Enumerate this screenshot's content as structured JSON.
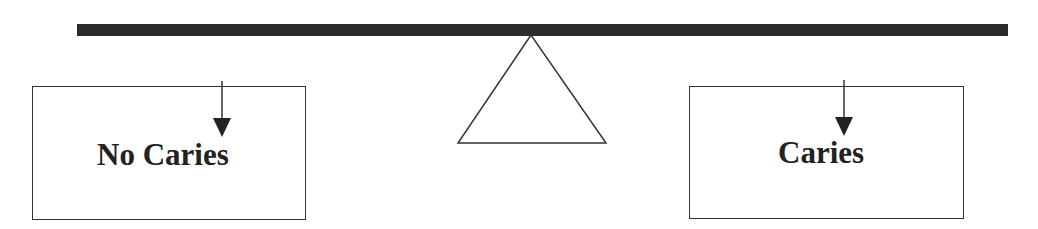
{
  "diagram": {
    "type": "balance-scale",
    "left": {
      "label": "No Caries"
    },
    "right": {
      "label": "Caries"
    },
    "colors": {
      "beam": "#2b2b2b",
      "stroke": "#333333",
      "text": "#222222"
    }
  }
}
